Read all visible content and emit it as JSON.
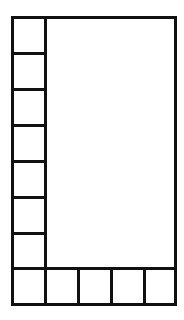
{
  "diagram": {
    "type": "grid-layout",
    "line_color": "#111111",
    "background": "#ffffff",
    "frame": {
      "x": 11,
      "y": 16,
      "width": 166,
      "height": 290
    },
    "left_column": {
      "cell_count": 7,
      "x": 11,
      "width": 36,
      "cells": [
        {
          "y": 16
        },
        {
          "y": 52
        },
        {
          "y": 88
        },
        {
          "y": 124
        },
        {
          "y": 160
        },
        {
          "y": 196
        },
        {
          "y": 232
        }
      ],
      "cell_height": 39
    },
    "bottom_row": {
      "cell_count": 5,
      "y": 267,
      "height": 39,
      "cells": [
        {
          "x": 11
        },
        {
          "x": 44
        },
        {
          "x": 77
        },
        {
          "x": 110
        },
        {
          "x": 143
        }
      ],
      "cell_width": 36
    },
    "main_area": {
      "x": 44,
      "y": 16,
      "width": 133,
      "height": 254
    }
  }
}
